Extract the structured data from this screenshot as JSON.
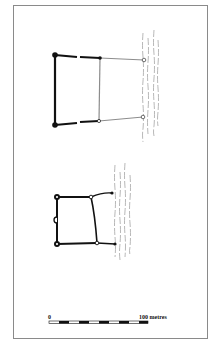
{
  "figure": {
    "type": "archaeological-site-plan",
    "plans": [
      {
        "id": "upper-plan",
        "description": "Rectangular enclosure with heavy west wall, lighter eastern annex extending to the river bank"
      },
      {
        "id": "lower-plan",
        "description": "Smaller rectangular enclosure with corner towers, a semicircular projection on the west wall and walls running east to the river"
      }
    ],
    "water": {
      "label": "river",
      "style": "dashed wavy lines"
    },
    "scale_bar": {
      "start_label": "0",
      "end_label": "100 metres",
      "segments": 10
    },
    "colors": {
      "ink": "#111111",
      "light_wall": "#8c8c8c",
      "water": "#9a9a9a",
      "frame": "#8a8a8a"
    }
  }
}
